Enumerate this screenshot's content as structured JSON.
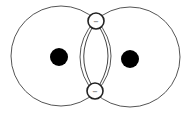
{
  "diagram": {
    "title": "",
    "colors": {
      "stroke": "#555555",
      "nucleus": "#000000",
      "background": "#ffffff"
    },
    "atoms": [
      {
        "name": "left-atom",
        "orbital": {
          "cx": 61,
          "cy": 56,
          "r": 50
        },
        "nucleus": {
          "cx": 59,
          "cy": 57,
          "r": 9
        }
      },
      {
        "name": "right-atom",
        "orbital": {
          "cx": 130,
          "cy": 57,
          "r": 50
        },
        "nucleus": {
          "cx": 130,
          "cy": 59,
          "r": 9
        }
      }
    ],
    "shared_electrons": [
      {
        "name": "top-electron",
        "cx": 96,
        "cy": 21,
        "r": 8,
        "sign": "−"
      },
      {
        "name": "bottom-electron",
        "cx": 95,
        "cy": 91,
        "r": 8,
        "sign": "−"
      }
    ]
  }
}
